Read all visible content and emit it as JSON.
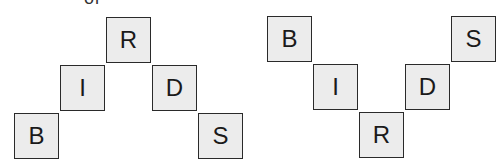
{
  "caption_fragment": "or",
  "diagrams": [
    {
      "name": "peak",
      "tiles": [
        {
          "letter": "B",
          "x": 14,
          "y": 113
        },
        {
          "letter": "I",
          "x": 60,
          "y": 65
        },
        {
          "letter": "R",
          "x": 106,
          "y": 17
        },
        {
          "letter": "D",
          "x": 152,
          "y": 65
        },
        {
          "letter": "S",
          "x": 198,
          "y": 113
        }
      ]
    },
    {
      "name": "valley",
      "tiles": [
        {
          "letter": "B",
          "x": 267,
          "y": 16
        },
        {
          "letter": "I",
          "x": 313,
          "y": 64
        },
        {
          "letter": "R",
          "x": 359,
          "y": 112
        },
        {
          "letter": "D",
          "x": 405,
          "y": 64
        },
        {
          "letter": "S",
          "x": 451,
          "y": 16
        }
      ]
    }
  ]
}
